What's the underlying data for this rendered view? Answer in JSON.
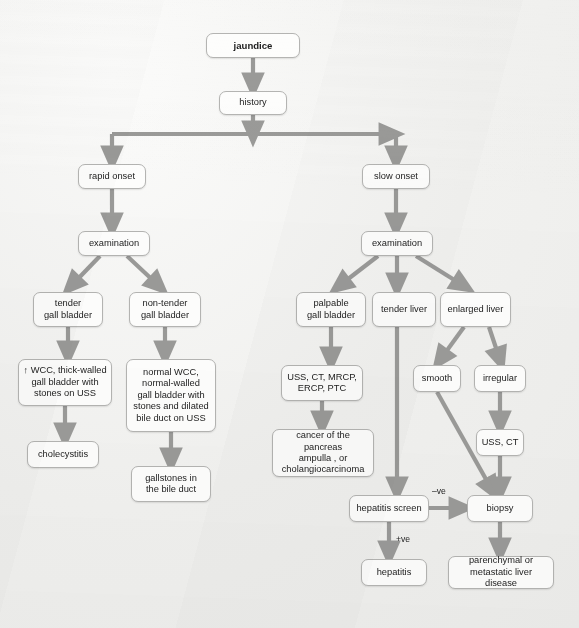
{
  "diagram": {
    "colors": {
      "background": "#f2f2f0",
      "node_fill": "#fdfdfc",
      "node_border": "#b4b4b2",
      "arrow": "#9a9a98",
      "text": "#1c1c1c"
    },
    "nodes": [
      {
        "id": "jaundice",
        "label": "jaundice",
        "x": 206,
        "y": 33,
        "w": 94,
        "h": 25,
        "bold": true
      },
      {
        "id": "history",
        "label": "history",
        "x": 219,
        "y": 91,
        "w": 68,
        "h": 24,
        "bold": false
      },
      {
        "id": "rapid_onset",
        "label": "rapid onset",
        "x": 78,
        "y": 164,
        "w": 68,
        "h": 25,
        "bold": false
      },
      {
        "id": "slow_onset",
        "label": "slow onset",
        "x": 362,
        "y": 164,
        "w": 68,
        "h": 25,
        "bold": false
      },
      {
        "id": "exam_left",
        "label": "examination",
        "x": 78,
        "y": 231,
        "w": 72,
        "h": 25,
        "bold": false
      },
      {
        "id": "exam_right",
        "label": "examination",
        "x": 361,
        "y": 231,
        "w": 72,
        "h": 25,
        "bold": false
      },
      {
        "id": "tender_gb",
        "label": "tender\ngall bladder",
        "x": 33,
        "y": 292,
        "w": 70,
        "h": 35,
        "bold": false
      },
      {
        "id": "nontender_gb",
        "label": "non-tender\ngall bladder",
        "x": 129,
        "y": 292,
        "w": 72,
        "h": 35,
        "bold": false
      },
      {
        "id": "palpable_gb",
        "label": "palpable\ngall bladder",
        "x": 296,
        "y": 292,
        "w": 70,
        "h": 35,
        "bold": false
      },
      {
        "id": "tender_liver",
        "label": "tender liver",
        "x": 372,
        "y": 292,
        "w": 64,
        "h": 35,
        "bold": false
      },
      {
        "id": "enlarged_liver",
        "label": "enlarged liver",
        "x": 440,
        "y": 292,
        "w": 71,
        "h": 35,
        "bold": false
      },
      {
        "id": "wcc_thick",
        "label": "↑ WCC, thick-walled\ngall bladder with\nstones on USS",
        "x": 18,
        "y": 359,
        "w": 94,
        "h": 47,
        "bold": false
      },
      {
        "id": "normal_wcc",
        "label": "normal WCC,\nnormal-walled\ngall bladder with\nstones and dilated\nbile duct on USS",
        "x": 126,
        "y": 359,
        "w": 90,
        "h": 73,
        "bold": false
      },
      {
        "id": "uss_ct_mrcp",
        "label": "USS, CT, MRCP,\nERCP, PTC",
        "x": 281,
        "y": 365,
        "w": 82,
        "h": 36,
        "bold": false
      },
      {
        "id": "smooth",
        "label": "smooth",
        "x": 413,
        "y": 365,
        "w": 48,
        "h": 27,
        "bold": false
      },
      {
        "id": "irregular",
        "label": "irregular",
        "x": 474,
        "y": 365,
        "w": 52,
        "h": 27,
        "bold": false
      },
      {
        "id": "cholecystitis",
        "label": "cholecystitis",
        "x": 27,
        "y": 441,
        "w": 72,
        "h": 27,
        "bold": false
      },
      {
        "id": "cancer",
        "label": "cancer of the pancreas\nampulla , or\ncholangiocarcinoma",
        "x": 272,
        "y": 429,
        "w": 102,
        "h": 48,
        "bold": false
      },
      {
        "id": "uss_ct",
        "label": "USS, CT",
        "x": 476,
        "y": 429,
        "w": 48,
        "h": 27,
        "bold": false
      },
      {
        "id": "gallstones",
        "label": "gallstones in\nthe bile duct",
        "x": 131,
        "y": 466,
        "w": 80,
        "h": 36,
        "bold": false
      },
      {
        "id": "hep_screen",
        "label": "hepatitis screen",
        "x": 349,
        "y": 495,
        "w": 80,
        "h": 27,
        "bold": false
      },
      {
        "id": "biopsy",
        "label": "biopsy",
        "x": 467,
        "y": 495,
        "w": 66,
        "h": 27,
        "bold": false
      },
      {
        "id": "hepatitis",
        "label": "hepatitis",
        "x": 361,
        "y": 559,
        "w": 66,
        "h": 27,
        "bold": false
      },
      {
        "id": "parenchymal",
        "label": "parenchymal or\nmetastatic liver disease",
        "x": 448,
        "y": 556,
        "w": 106,
        "h": 33,
        "bold": false
      }
    ],
    "edge_labels": [
      {
        "id": "neg",
        "label": "–ve",
        "x": 432,
        "y": 486
      },
      {
        "id": "pos",
        "label": "+ve",
        "x": 396,
        "y": 534
      }
    ],
    "edges": [
      {
        "from": "jaundice",
        "to": "history",
        "kind": "vertical"
      },
      {
        "from": "history",
        "to": "rapid_onset",
        "kind": "elbow-left"
      },
      {
        "from": "history",
        "to": "slow_onset",
        "kind": "elbow-right"
      },
      {
        "from": "rapid_onset",
        "to": "exam_left",
        "kind": "vertical"
      },
      {
        "from": "slow_onset",
        "to": "exam_right",
        "kind": "vertical"
      },
      {
        "from": "exam_left",
        "to": "tender_gb",
        "kind": "diagonal"
      },
      {
        "from": "exam_left",
        "to": "nontender_gb",
        "kind": "diagonal"
      },
      {
        "from": "exam_right",
        "to": "palpable_gb",
        "kind": "diagonal"
      },
      {
        "from": "exam_right",
        "to": "tender_liver",
        "kind": "vertical"
      },
      {
        "from": "exam_right",
        "to": "enlarged_liver",
        "kind": "diagonal"
      },
      {
        "from": "tender_gb",
        "to": "wcc_thick",
        "kind": "vertical"
      },
      {
        "from": "nontender_gb",
        "to": "normal_wcc",
        "kind": "vertical"
      },
      {
        "from": "palpable_gb",
        "to": "uss_ct_mrcp",
        "kind": "vertical"
      },
      {
        "from": "enlarged_liver",
        "to": "smooth",
        "kind": "diagonal"
      },
      {
        "from": "enlarged_liver",
        "to": "irregular",
        "kind": "diagonal"
      },
      {
        "from": "wcc_thick",
        "to": "cholecystitis",
        "kind": "vertical"
      },
      {
        "from": "normal_wcc",
        "to": "gallstones",
        "kind": "vertical"
      },
      {
        "from": "uss_ct_mrcp",
        "to": "cancer",
        "kind": "vertical"
      },
      {
        "from": "irregular",
        "to": "uss_ct",
        "kind": "vertical"
      },
      {
        "from": "tender_liver",
        "to": "hep_screen",
        "kind": "long-vertical"
      },
      {
        "from": "smooth",
        "to": "biopsy",
        "kind": "diagonal-long"
      },
      {
        "from": "uss_ct",
        "to": "biopsy",
        "kind": "vertical"
      },
      {
        "from": "hep_screen",
        "to": "biopsy",
        "kind": "horizontal",
        "label": "–ve"
      },
      {
        "from": "hep_screen",
        "to": "hepatitis",
        "kind": "vertical",
        "label": "+ve"
      },
      {
        "from": "biopsy",
        "to": "parenchymal",
        "kind": "vertical"
      }
    ]
  }
}
